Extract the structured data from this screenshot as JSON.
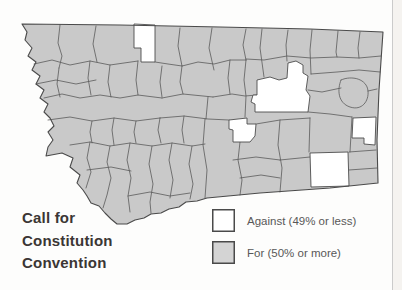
{
  "map": {
    "state": "Montana",
    "description": "Montana county map of vote on call for constitution convention",
    "fill_color": "#c9c9c9",
    "line_color": "#5b5b5b",
    "outline_color": "#4a4a4a",
    "against_fill": "#ffffff",
    "against_region_count": 5
  },
  "title": {
    "text": "Call for Constitution Convention",
    "lines": [
      "Call for",
      "Constitution",
      "Convention"
    ]
  },
  "legend": {
    "items": [
      {
        "label": "Against (49% or less)",
        "swatch": "#ffffff",
        "border": "#4a4a4a"
      },
      {
        "label": "For (50% or more)",
        "swatch": "#d4d4d4",
        "border": "#4a4a4a"
      }
    ]
  }
}
